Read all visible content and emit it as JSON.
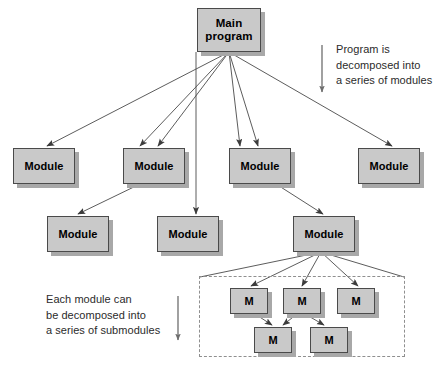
{
  "diagram": {
    "canvas": {
      "width": 434,
      "height": 380,
      "background": "#ffffff"
    },
    "style": {
      "node_fill": "#c9c9c9",
      "node_border": "#4a4a4a",
      "node_shadow": "#a8a8a8",
      "line_color": "#4a4a4a",
      "dash_border": "#8f8f8f",
      "note_color": "#2b2b2b"
    },
    "root": {
      "label": "Main\nprogram",
      "x": 197,
      "y": 8,
      "w": 64,
      "h": 44
    },
    "modules_row1": [
      {
        "label": "Module",
        "x": 13,
        "y": 148,
        "w": 62,
        "h": 36
      },
      {
        "label": "Module",
        "x": 123,
        "y": 148,
        "w": 62,
        "h": 36
      },
      {
        "label": "Module",
        "x": 229,
        "y": 148,
        "w": 62,
        "h": 36
      },
      {
        "label": "Module",
        "x": 358,
        "y": 148,
        "w": 62,
        "h": 36
      }
    ],
    "modules_row2": [
      {
        "label": "Module",
        "x": 47,
        "y": 216,
        "w": 62,
        "h": 36
      },
      {
        "label": "Module",
        "x": 157,
        "y": 216,
        "w": 62,
        "h": 36
      },
      {
        "label": "Module",
        "x": 293,
        "y": 216,
        "w": 62,
        "h": 36
      }
    ],
    "submodules_row1": [
      {
        "label": "M",
        "x": 230,
        "y": 288,
        "w": 38,
        "h": 26
      },
      {
        "label": "M",
        "x": 283,
        "y": 288,
        "w": 38,
        "h": 26
      },
      {
        "label": "M",
        "x": 337,
        "y": 288,
        "w": 38,
        "h": 26
      }
    ],
    "submodules_row2": [
      {
        "label": "M",
        "x": 254,
        "y": 327,
        "w": 38,
        "h": 26
      },
      {
        "label": "M",
        "x": 310,
        "y": 327,
        "w": 38,
        "h": 26
      }
    ],
    "dashed_group": {
      "x": 199,
      "y": 276,
      "w": 206,
      "h": 81
    },
    "notes": [
      {
        "id": "note-top",
        "text": "Program is\ndecomposed into\na series of modules",
        "x": 336,
        "y": 42
      },
      {
        "id": "note-bottom",
        "text": "Each module can\nbe decomposed into\na series of submodules",
        "x": 46,
        "y": 292
      }
    ],
    "note_arrows": [
      {
        "id": "note-top-arrow",
        "x1": 322,
        "y1": 45,
        "x2": 322,
        "y2": 92
      },
      {
        "id": "note-bottom-arrow",
        "x1": 178,
        "y1": 296,
        "x2": 178,
        "y2": 340
      }
    ],
    "edges": [
      {
        "from": "root",
        "to": "modules_row1.0",
        "x1": 229,
        "y1": 52,
        "x2": 47,
        "y2": 146
      },
      {
        "from": "root",
        "to": "modules_row1.1",
        "x1": 229,
        "y1": 52,
        "x2": 158,
        "y2": 146
      },
      {
        "from": "root",
        "to": "modules_row1.2",
        "x1": 229,
        "y1": 52,
        "x2": 258,
        "y2": 146
      },
      {
        "from": "root",
        "to": "modules_row1.3",
        "x1": 229,
        "y1": 52,
        "x2": 392,
        "y2": 146
      },
      {
        "from": "root",
        "to": "modules_row2.1",
        "x1": 196,
        "y1": 52,
        "x2": 196,
        "y2": 214
      },
      {
        "from": "root",
        "to": "modules_row1.1b",
        "x1": 229,
        "y1": 52,
        "x2": 140,
        "y2": 146
      },
      {
        "from": "root",
        "to": "modules_row1.2b",
        "x1": 229,
        "y1": 52,
        "x2": 240,
        "y2": 146
      },
      {
        "from": "modules_row1.1",
        "to": "modules_row2.0",
        "x1": 140,
        "y1": 184,
        "x2": 78,
        "y2": 214
      },
      {
        "from": "modules_row1.2",
        "to": "modules_row2.2",
        "x1": 276,
        "y1": 184,
        "x2": 323,
        "y2": 214
      },
      {
        "from": "modules_row2.2",
        "to": "submodules_row1.0",
        "x1": 321,
        "y1": 252,
        "x2": 251,
        "y2": 286
      },
      {
        "from": "modules_row2.2",
        "to": "submodules_row1.1",
        "x1": 321,
        "y1": 252,
        "x2": 302,
        "y2": 286
      },
      {
        "from": "modules_row2.2",
        "to": "submodules_row1.2",
        "x1": 321,
        "y1": 252,
        "x2": 358,
        "y2": 286
      },
      {
        "from": "submodules_row1.0",
        "to": "submodules_row2.0",
        "x1": 255,
        "y1": 314,
        "x2": 272,
        "y2": 325
      },
      {
        "from": "submodules_row1.1",
        "to": "submodules_row2.0",
        "x1": 297,
        "y1": 314,
        "x2": 283,
        "y2": 325
      },
      {
        "from": "submodules_row1.1",
        "to": "submodules_row2.1",
        "x1": 305,
        "y1": 314,
        "x2": 324,
        "y2": 325
      }
    ],
    "dashed_fan": [
      {
        "x1": 321,
        "y1": 252,
        "x2": 200,
        "y2": 277
      },
      {
        "x1": 321,
        "y1": 252,
        "x2": 404,
        "y2": 277
      }
    ]
  }
}
